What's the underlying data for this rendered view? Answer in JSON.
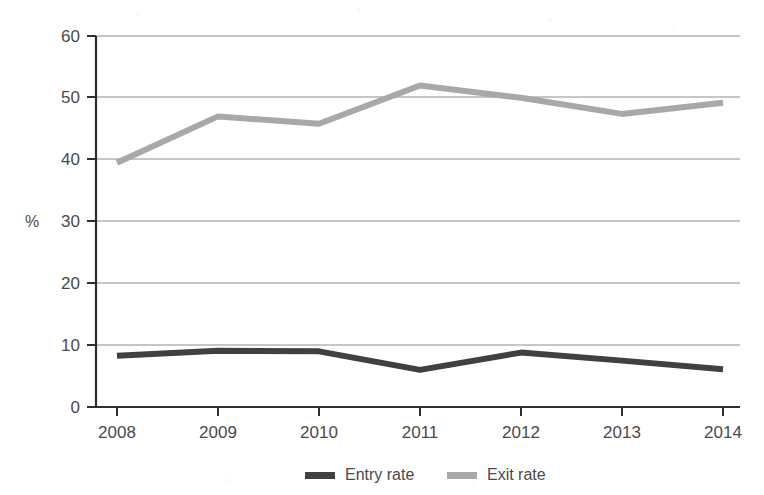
{
  "chart_data": {
    "type": "line",
    "title": "",
    "subtitle": "",
    "xlabel": "",
    "ylabel": "%",
    "categories": [
      "2008",
      "2009",
      "2010",
      "2011",
      "2012",
      "2013",
      "2014"
    ],
    "x": [
      2008,
      2009,
      2010,
      2011,
      2012,
      2013,
      2014
    ],
    "xlim": [
      2008,
      2014
    ],
    "ylim": [
      0,
      60
    ],
    "y_ticks": [
      0,
      10,
      20,
      30,
      40,
      50,
      60
    ],
    "y_tick_labels": [
      "0",
      "10",
      "20",
      "30",
      "40",
      "50",
      "60"
    ],
    "grid": "horizontal",
    "legend_position": "bottom",
    "series": [
      {
        "name": "Entry rate",
        "color": "#404040",
        "values": [
          8.3,
          9.1,
          9.0,
          6.0,
          8.8,
          7.5,
          6.1
        ]
      },
      {
        "name": "Exit rate",
        "color": "#a8a8a8",
        "values": [
          39.5,
          47.0,
          45.8,
          52.0,
          50.0,
          47.4,
          49.2
        ]
      }
    ]
  },
  "axis": {
    "y_title": "%",
    "y_tick_labels": [
      "60",
      "50",
      "40",
      "30",
      "20",
      "10",
      "0"
    ],
    "x_tick_labels": [
      "2008",
      "2009",
      "2010",
      "2011",
      "2012",
      "2013",
      "2014"
    ]
  },
  "legend": {
    "items": [
      {
        "label": "Entry rate",
        "color": "#404040"
      },
      {
        "label": "Exit rate",
        "color": "#a8a8a8"
      }
    ]
  }
}
